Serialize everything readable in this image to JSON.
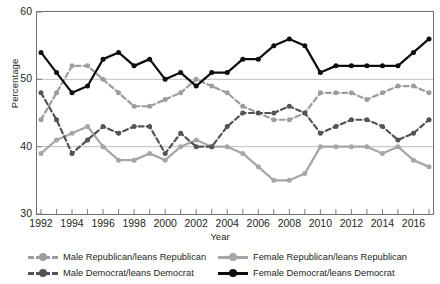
{
  "chart_data": {
    "type": "line",
    "title": "",
    "xlabel": "Year",
    "ylabel": "Percentage",
    "xlim": [
      1992,
      2017
    ],
    "ylim": [
      30,
      60
    ],
    "yticks": [
      30,
      40,
      50,
      60
    ],
    "xticks": [
      1992,
      1994,
      1996,
      1998,
      2000,
      2002,
      2004,
      2006,
      2008,
      2010,
      2012,
      2014,
      2016
    ],
    "x": [
      1992,
      1993,
      1994,
      1995,
      1996,
      1997,
      1998,
      1999,
      2000,
      2001,
      2002,
      2003,
      2004,
      2005,
      2006,
      2007,
      2008,
      2009,
      2010,
      2011,
      2012,
      2013,
      2014,
      2015,
      2016,
      2017
    ],
    "grid": "horizontal",
    "legend_position": "bottom",
    "series": [
      {
        "name": "Male Republican/leans Republican",
        "color": "#9d9d9d",
        "style": "dashed",
        "values": [
          44,
          48,
          52,
          52,
          50,
          48,
          46,
          46,
          47,
          48,
          50,
          49,
          48,
          46,
          45,
          44,
          44,
          45,
          48,
          48,
          48,
          47,
          48,
          49,
          49,
          48
        ]
      },
      {
        "name": "Male Democrat/leans Democrat",
        "color": "#545454",
        "style": "dashed",
        "values": [
          48,
          44,
          39,
          41,
          43,
          42,
          43,
          43,
          39,
          42,
          40,
          40,
          43,
          45,
          45,
          45,
          46,
          45,
          42,
          43,
          44,
          44,
          43,
          41,
          42,
          44
        ]
      },
      {
        "name": "Female Republican/leans Republican",
        "color": "#a6a6a6",
        "style": "solid",
        "values": [
          39,
          41,
          42,
          43,
          40,
          38,
          38,
          39,
          38,
          40,
          41,
          40,
          40,
          39,
          37,
          35,
          35,
          36,
          40,
          40,
          40,
          40,
          39,
          40,
          38,
          37
        ]
      },
      {
        "name": "Female Democrat/leans Democrat",
        "color": "#0d0d0d",
        "style": "solid",
        "values": [
          54,
          51,
          48,
          49,
          53,
          54,
          52,
          53,
          50,
          51,
          49,
          51,
          51,
          53,
          53,
          55,
          56,
          55,
          51,
          52,
          52,
          52,
          52,
          52,
          54,
          56
        ]
      }
    ]
  },
  "axis": {
    "ylabel": "Percentage",
    "xlabel": "Year",
    "ytick_labels": [
      "60",
      "50",
      "40",
      "30"
    ],
    "xtick_labels": [
      "1992",
      "1994",
      "1996",
      "1998",
      "2000",
      "2002",
      "2004",
      "2006",
      "2008",
      "2010",
      "2012",
      "2014",
      "2016"
    ]
  },
  "legend": {
    "items": [
      {
        "label": "Male Republican/leans Republican",
        "color": "#9d9d9d",
        "style": "dashed"
      },
      {
        "label": "Female Republican/leans Republican",
        "color": "#a6a6a6",
        "style": "solid"
      },
      {
        "label": "Male Democrat/leans Democrat",
        "color": "#545454",
        "style": "dashed"
      },
      {
        "label": "Female Democrat/leans Democrat",
        "color": "#0d0d0d",
        "style": "solid"
      }
    ]
  }
}
